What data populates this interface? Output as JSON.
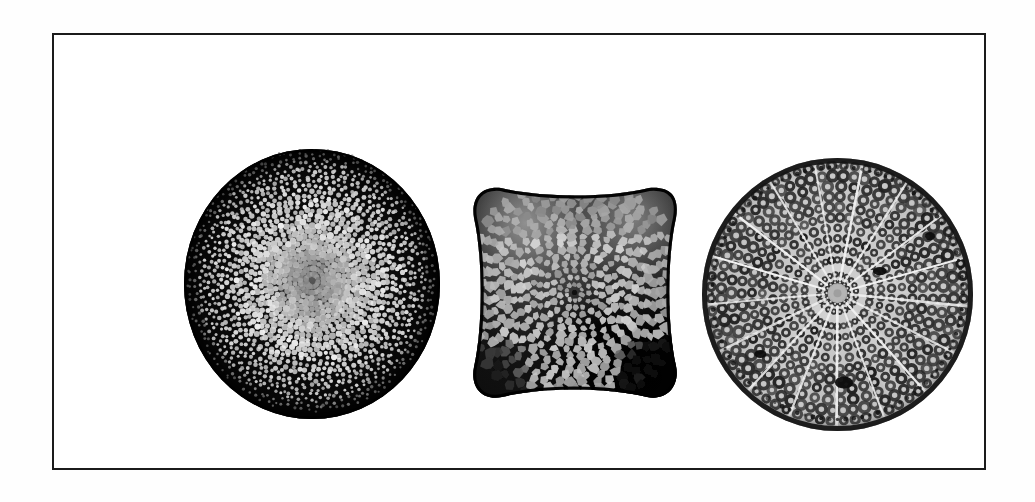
{
  "plate": {
    "title": "Diatom frustules microscope plate",
    "caption": "",
    "medium": "black-and-white photomicrograph",
    "background_color": "#ffffff",
    "frame": {
      "color": "#1b1b1b",
      "thickness_px": 2,
      "x": 52,
      "y": 33,
      "width": 934,
      "height": 437
    }
  },
  "specimens": [
    {
      "id": "specimen-1",
      "label": "",
      "shape": "circular valve",
      "appearance": "dark field, light round areolae in radiating rows",
      "center_x": 258,
      "center_y": 249,
      "width": 256,
      "height": 270,
      "fill_color": "#0a0a0a",
      "areola_color": "#e8e8e8",
      "areola_rows": 26,
      "areola_count_approx": 1500,
      "center_hub_color": "#6b6b6b"
    },
    {
      "id": "specimen-2",
      "label": "",
      "shape": "cushion / rounded-square valve with concave margins",
      "appearance": "polygonal honeycomb areolae, light cells on dark walls",
      "center_x": 521,
      "center_y": 257,
      "width": 209,
      "height": 217,
      "wall_color": "#101010",
      "cell_color": "#c9c9c9",
      "corner_shadow_color": "#000000",
      "cell_count_approx": 620,
      "highlight_corners": [
        "top-left",
        "top-right"
      ],
      "dark_corners": [
        "bottom-right",
        "bottom-left"
      ]
    },
    {
      "id": "specimen-3",
      "label": "",
      "shape": "circular valve",
      "appearance": "pale valve with white radial ribs dividing sectors, dark ring-shaped areolae in concentric arcs",
      "center_x": 783,
      "center_y": 259,
      "width": 271,
      "height": 273,
      "base_color": "#c9c9c9",
      "rib_color": "#f2f2f2",
      "areola_color": "#1e1e1e",
      "rib_count": 17,
      "concentric_rings": 9,
      "central_hub_color": "#b4b4b4",
      "central_hub_diameter_px": 20,
      "dark_blemishes": 4
    }
  ],
  "colors": {
    "page": "#ffffff",
    "ink": "#1b1b1b",
    "dark_field": "#0a0a0a",
    "mid_grey": "#8a8a8a",
    "light_grey": "#d2d2d2"
  }
}
